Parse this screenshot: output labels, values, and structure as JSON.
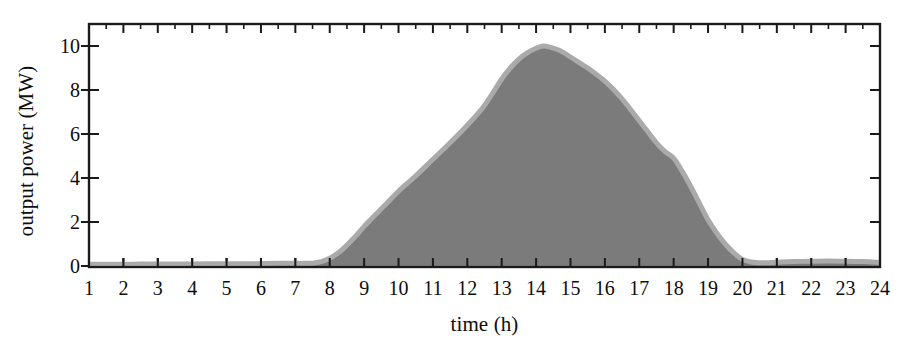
{
  "figure": {
    "background_color": "#ffffff",
    "axis_color": "#1a1a1a"
  },
  "chart_data": {
    "type": "area",
    "title": "",
    "xlabel": "time (h)",
    "ylabel": "output power (MW)",
    "xlim": [
      1,
      24
    ],
    "ylim": [
      0,
      11
    ],
    "grid": false,
    "legend": "none",
    "fill_color": "#7b7b7b",
    "line_color": "#aaaaaa",
    "line_width_px": 5,
    "xticks": [
      1,
      2,
      3,
      4,
      5,
      6,
      7,
      8,
      9,
      10,
      11,
      12,
      13,
      14,
      15,
      16,
      17,
      18,
      19,
      20,
      21,
      22,
      23,
      24
    ],
    "xtick_labels": [
      "1",
      "2",
      "3",
      "4",
      "5",
      "6",
      "7",
      "8",
      "9",
      "10",
      "11",
      "12",
      "13",
      "14",
      "15",
      "16",
      "17",
      "18",
      "19",
      "20",
      "21",
      "22",
      "23",
      "24"
    ],
    "yticks": [
      0,
      2,
      4,
      6,
      8,
      10
    ],
    "ytick_labels": [
      "0",
      "2",
      "4",
      "6",
      "8",
      "10"
    ],
    "minor_xticks": true,
    "series": [
      {
        "name": "output power",
        "x": [
          1,
          1.5,
          2,
          2.5,
          3,
          3.5,
          4,
          4.5,
          5,
          5.5,
          6,
          6.5,
          7,
          7.25,
          7.5,
          7.75,
          8,
          8.25,
          8.5,
          8.75,
          9,
          9.25,
          9.5,
          9.75,
          10,
          10.5,
          11,
          11.5,
          12,
          12.5,
          13,
          13.25,
          13.5,
          13.75,
          14,
          14.2,
          14.4,
          14.6,
          14.8,
          15,
          15.5,
          16,
          16.5,
          17,
          17.25,
          17.5,
          17.75,
          18,
          18.25,
          18.5,
          18.75,
          19,
          19.25,
          19.5,
          19.75,
          20,
          20.25,
          20.5,
          20.75,
          21,
          21.5,
          22,
          22.5,
          23,
          23.5,
          24
        ],
        "y": [
          0.08,
          0.08,
          0.08,
          0.09,
          0.09,
          0.09,
          0.09,
          0.1,
          0.1,
          0.1,
          0.11,
          0.12,
          0.12,
          0.12,
          0.13,
          0.2,
          0.35,
          0.6,
          0.95,
          1.35,
          1.8,
          2.2,
          2.6,
          3.0,
          3.4,
          4.1,
          4.85,
          5.6,
          6.4,
          7.3,
          8.5,
          9.0,
          9.4,
          9.7,
          9.9,
          10.0,
          9.95,
          9.85,
          9.7,
          9.5,
          9.0,
          8.4,
          7.6,
          6.6,
          6.1,
          5.6,
          5.2,
          4.9,
          4.3,
          3.6,
          2.85,
          2.1,
          1.5,
          1.0,
          0.6,
          0.3,
          0.18,
          0.15,
          0.15,
          0.17,
          0.2,
          0.22,
          0.23,
          0.22,
          0.2,
          0.16
        ]
      }
    ]
  }
}
